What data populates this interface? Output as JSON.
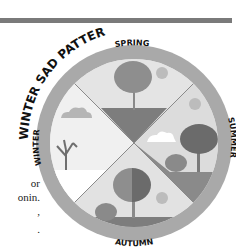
{
  "figure": {
    "title": "WINTER SAD PATTERN",
    "seasons": {
      "spring": "SPRING",
      "summer": "SUMMER",
      "autumn": "AUTUMN",
      "winter": "WINTER"
    }
  },
  "body_text_fragments": [
    "or",
    "onin.",
    ",",
    "."
  ],
  "colors": {
    "ring": "#a9a9a9",
    "sky_light": "#e6e6e6",
    "ground_dark": "#7d7d7d",
    "tree_dark": "#6e6e6e",
    "tree_mid": "#8e8e8e",
    "sun": "#b9b9b9",
    "rule": "#7a7a7a"
  }
}
